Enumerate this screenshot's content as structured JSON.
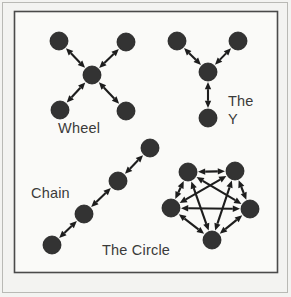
{
  "figure": {
    "background_color": "#f3f3f1",
    "panel_color": "#fafaf8",
    "node_color": "#333333",
    "edge_color": "#1d1d1d",
    "text_color": "#3a3a3a",
    "panel": {
      "x": 14,
      "y": 11,
      "width": 263,
      "height": 261
    }
  },
  "labels": {
    "wheel": "Wheel",
    "the": "The",
    "y": "Y",
    "chain": "Chain",
    "the_circle": "The Circle"
  },
  "chart_data": {
    "type": "diagram",
    "networks": [
      {
        "name": "Wheel",
        "label": "Wheel",
        "label_pos": {
          "x": 58,
          "y": 133
        },
        "node_radius": 9,
        "nodes": [
          {
            "id": "w_tl",
            "x": 59,
            "y": 41
          },
          {
            "id": "w_tr",
            "x": 126,
            "y": 42
          },
          {
            "id": "w_c",
            "x": 92,
            "y": 75
          },
          {
            "id": "w_bl",
            "x": 60,
            "y": 110
          },
          {
            "id": "w_br",
            "x": 126,
            "y": 111
          }
        ],
        "edges": [
          {
            "from": "w_c",
            "to": "w_tl",
            "arrows": "both"
          },
          {
            "from": "w_c",
            "to": "w_tr",
            "arrows": "both"
          },
          {
            "from": "w_c",
            "to": "w_bl",
            "arrows": "both"
          },
          {
            "from": "w_c",
            "to": "w_br",
            "arrows": "both"
          }
        ]
      },
      {
        "name": "The Y",
        "label": "The Y",
        "label_lines": [
          "The",
          "Y"
        ],
        "label_pos": {
          "x": 228,
          "y": 106
        },
        "node_radius": 9,
        "nodes": [
          {
            "id": "y_tl",
            "x": 177,
            "y": 41
          },
          {
            "id": "y_tr",
            "x": 238,
            "y": 41
          },
          {
            "id": "y_c",
            "x": 208,
            "y": 72
          },
          {
            "id": "y_b",
            "x": 208,
            "y": 118
          }
        ],
        "edges": [
          {
            "from": "y_c",
            "to": "y_tl",
            "arrows": "both"
          },
          {
            "from": "y_c",
            "to": "y_tr",
            "arrows": "both"
          },
          {
            "from": "y_c",
            "to": "y_b",
            "arrows": "both"
          }
        ]
      },
      {
        "name": "Chain",
        "label": "Chain",
        "label_pos": {
          "x": 31,
          "y": 198
        },
        "node_radius": 9,
        "nodes": [
          {
            "id": "c1",
            "x": 52,
            "y": 245
          },
          {
            "id": "c2",
            "x": 84,
            "y": 214
          },
          {
            "id": "c3",
            "x": 118,
            "y": 181
          },
          {
            "id": "c4",
            "x": 150,
            "y": 148
          }
        ],
        "edges": [
          {
            "from": "c1",
            "to": "c2",
            "arrows": "both"
          },
          {
            "from": "c2",
            "to": "c3",
            "arrows": "both"
          },
          {
            "from": "c3",
            "to": "c4",
            "arrows": "both"
          }
        ]
      },
      {
        "name": "The Circle",
        "label": "The Circle",
        "label_pos": {
          "x": 102,
          "y": 255
        },
        "node_radius": 9,
        "nodes": [
          {
            "id": "p_tl",
            "x": 188,
            "y": 172
          },
          {
            "id": "p_tr",
            "x": 235,
            "y": 171
          },
          {
            "id": "p_l",
            "x": 171,
            "y": 208
          },
          {
            "id": "p_r",
            "x": 250,
            "y": 209
          },
          {
            "id": "p_b",
            "x": 212,
            "y": 240
          }
        ],
        "edges": [
          {
            "from": "p_tl",
            "to": "p_tr",
            "arrows": "both"
          },
          {
            "from": "p_tl",
            "to": "p_l",
            "arrows": "both"
          },
          {
            "from": "p_tl",
            "to": "p_r",
            "arrows": "both"
          },
          {
            "from": "p_tl",
            "to": "p_b",
            "arrows": "both"
          },
          {
            "from": "p_tr",
            "to": "p_l",
            "arrows": "both"
          },
          {
            "from": "p_tr",
            "to": "p_r",
            "arrows": "both"
          },
          {
            "from": "p_tr",
            "to": "p_b",
            "arrows": "both"
          },
          {
            "from": "p_l",
            "to": "p_r",
            "arrows": "both"
          },
          {
            "from": "p_l",
            "to": "p_b",
            "arrows": "both"
          },
          {
            "from": "p_r",
            "to": "p_b",
            "arrows": "both"
          }
        ]
      }
    ]
  }
}
